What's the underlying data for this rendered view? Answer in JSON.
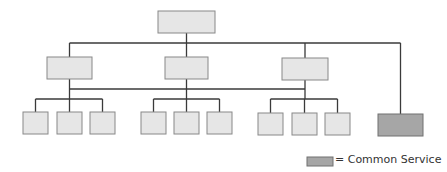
{
  "diagram": {
    "colors": {
      "line": "#3a3a3a",
      "node_fill": "#e6e6e6",
      "node_stroke": "#888888",
      "common_fill": "#a6a6a6",
      "common_stroke": "#707070"
    },
    "root": {
      "x": 158,
      "y": 11,
      "w": 57,
      "h": 22
    },
    "level2": [
      {
        "x": 47,
        "y": 57,
        "w": 45,
        "h": 22
      },
      {
        "x": 165,
        "y": 57,
        "w": 43,
        "h": 22
      },
      {
        "x": 282,
        "y": 58,
        "w": 46,
        "h": 22
      }
    ],
    "leaves": [
      {
        "x": 23,
        "y": 112,
        "w": 25,
        "h": 22
      },
      {
        "x": 57,
        "y": 112,
        "w": 25,
        "h": 22
      },
      {
        "x": 90,
        "y": 112,
        "w": 25,
        "h": 22
      },
      {
        "x": 141,
        "y": 112,
        "w": 25,
        "h": 22
      },
      {
        "x": 174,
        "y": 112,
        "w": 25,
        "h": 22
      },
      {
        "x": 207,
        "y": 112,
        "w": 25,
        "h": 22
      },
      {
        "x": 258,
        "y": 113,
        "w": 25,
        "h": 22
      },
      {
        "x": 292,
        "y": 113,
        "w": 25,
        "h": 22
      },
      {
        "x": 325,
        "y": 113,
        "w": 25,
        "h": 22
      }
    ],
    "common_service_node": {
      "x": 378,
      "y": 114,
      "w": 45,
      "h": 22
    }
  },
  "legend": {
    "label": "= Common Service"
  }
}
